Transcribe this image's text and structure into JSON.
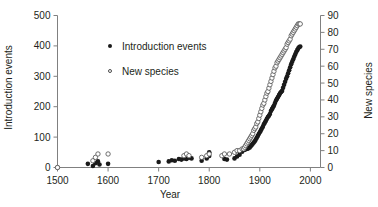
{
  "figure": {
    "xlabel": "Year",
    "ylabel_left": "Introduction events",
    "ylabel_right": "New species",
    "legend": [
      {
        "label": "Introduction events",
        "marker": "filled-circle-icon"
      },
      {
        "label": "New species",
        "marker": "open-circle-icon"
      }
    ]
  },
  "chart_data": {
    "type": "scatter",
    "title": "",
    "xlabel": "Year",
    "ylabel": "Introduction events",
    "y2label": "New species",
    "grid": false,
    "legend_position": "upper-left-inside",
    "xlim": [
      1500,
      2020
    ],
    "xticks": [
      1500,
      1600,
      1700,
      1800,
      1900,
      2000
    ],
    "ylim": [
      0,
      500
    ],
    "yticks": [
      0,
      100,
      200,
      300,
      400,
      500
    ],
    "y2lim": [
      0,
      90
    ],
    "y2ticks": [
      0,
      10,
      20,
      30,
      40,
      50,
      60,
      70,
      80,
      90
    ],
    "series": [
      {
        "name": "Introduction events",
        "marker": "filled-circle",
        "color": "#1a1a1a",
        "axis": "left",
        "points": [
          [
            1500,
            0
          ],
          [
            1560,
            12
          ],
          [
            1570,
            5
          ],
          [
            1575,
            14
          ],
          [
            1580,
            20
          ],
          [
            1583,
            10
          ],
          [
            1600,
            12
          ],
          [
            1700,
            18
          ],
          [
            1720,
            20
          ],
          [
            1726,
            24
          ],
          [
            1732,
            22
          ],
          [
            1740,
            28
          ],
          [
            1745,
            26
          ],
          [
            1750,
            30
          ],
          [
            1755,
            28
          ],
          [
            1760,
            32
          ],
          [
            1765,
            30
          ],
          [
            1785,
            22
          ],
          [
            1795,
            30
          ],
          [
            1800,
            38
          ],
          [
            1800,
            50
          ],
          [
            1830,
            28
          ],
          [
            1835,
            26
          ],
          [
            1850,
            30
          ],
          [
            1855,
            36
          ],
          [
            1860,
            42
          ],
          [
            1865,
            52
          ],
          [
            1870,
            58
          ],
          [
            1872,
            60
          ],
          [
            1874,
            62
          ],
          [
            1876,
            62
          ],
          [
            1878,
            64
          ],
          [
            1880,
            66
          ],
          [
            1882,
            70
          ],
          [
            1884,
            74
          ],
          [
            1886,
            78
          ],
          [
            1888,
            82
          ],
          [
            1890,
            86
          ],
          [
            1892,
            92
          ],
          [
            1894,
            98
          ],
          [
            1896,
            104
          ],
          [
            1898,
            110
          ],
          [
            1900,
            116
          ],
          [
            1902,
            122
          ],
          [
            1904,
            128
          ],
          [
            1906,
            134
          ],
          [
            1908,
            142
          ],
          [
            1910,
            148
          ],
          [
            1912,
            154
          ],
          [
            1914,
            160
          ],
          [
            1916,
            166
          ],
          [
            1918,
            170
          ],
          [
            1920,
            176
          ],
          [
            1922,
            186
          ],
          [
            1924,
            192
          ],
          [
            1926,
            198
          ],
          [
            1928,
            204
          ],
          [
            1930,
            212
          ],
          [
            1932,
            220
          ],
          [
            1934,
            226
          ],
          [
            1936,
            232
          ],
          [
            1938,
            238
          ],
          [
            1940,
            244
          ],
          [
            1942,
            248
          ],
          [
            1944,
            252
          ],
          [
            1946,
            262
          ],
          [
            1948,
            272
          ],
          [
            1950,
            282
          ],
          [
            1952,
            292
          ],
          [
            1954,
            300
          ],
          [
            1956,
            310
          ],
          [
            1958,
            320
          ],
          [
            1960,
            330
          ],
          [
            1962,
            340
          ],
          [
            1964,
            348
          ],
          [
            1966,
            356
          ],
          [
            1968,
            364
          ],
          [
            1970,
            372
          ],
          [
            1972,
            380
          ],
          [
            1974,
            386
          ],
          [
            1976,
            392
          ],
          [
            1978,
            396
          ],
          [
            1980,
            398
          ]
        ]
      },
      {
        "name": "New species",
        "marker": "open-circle",
        "color": "#4d4d4d",
        "axis": "right",
        "points": [
          [
            1500,
            0
          ],
          [
            1570,
            4
          ],
          [
            1575,
            6
          ],
          [
            1580,
            8
          ],
          [
            1600,
            8
          ],
          [
            1750,
            7
          ],
          [
            1755,
            8
          ],
          [
            1760,
            7
          ],
          [
            1785,
            6
          ],
          [
            1795,
            7
          ],
          [
            1800,
            8
          ],
          [
            1825,
            7
          ],
          [
            1830,
            8
          ],
          [
            1840,
            8
          ],
          [
            1850,
            9
          ],
          [
            1855,
            10
          ],
          [
            1860,
            10
          ],
          [
            1865,
            11
          ],
          [
            1868,
            11
          ],
          [
            1870,
            12
          ],
          [
            1872,
            13
          ],
          [
            1874,
            14
          ],
          [
            1876,
            15
          ],
          [
            1878,
            16
          ],
          [
            1880,
            17
          ],
          [
            1882,
            18
          ],
          [
            1884,
            19
          ],
          [
            1886,
            20
          ],
          [
            1888,
            22
          ],
          [
            1890,
            23
          ],
          [
            1892,
            24
          ],
          [
            1894,
            26
          ],
          [
            1896,
            27
          ],
          [
            1898,
            29
          ],
          [
            1900,
            31
          ],
          [
            1902,
            33
          ],
          [
            1904,
            35
          ],
          [
            1906,
            37
          ],
          [
            1908,
            38
          ],
          [
            1910,
            40
          ],
          [
            1912,
            42
          ],
          [
            1914,
            44
          ],
          [
            1916,
            45
          ],
          [
            1918,
            47
          ],
          [
            1920,
            49
          ],
          [
            1922,
            51
          ],
          [
            1924,
            53
          ],
          [
            1926,
            55
          ],
          [
            1928,
            57
          ],
          [
            1930,
            59
          ],
          [
            1932,
            60
          ],
          [
            1934,
            62
          ],
          [
            1936,
            63
          ],
          [
            1938,
            64
          ],
          [
            1940,
            65
          ],
          [
            1942,
            66
          ],
          [
            1944,
            67
          ],
          [
            1946,
            68
          ],
          [
            1948,
            69
          ],
          [
            1950,
            70
          ],
          [
            1952,
            71
          ],
          [
            1954,
            73
          ],
          [
            1956,
            74
          ],
          [
            1958,
            75
          ],
          [
            1960,
            76
          ],
          [
            1962,
            78
          ],
          [
            1964,
            79
          ],
          [
            1966,
            80
          ],
          [
            1968,
            81
          ],
          [
            1970,
            82
          ],
          [
            1972,
            83
          ],
          [
            1974,
            84
          ],
          [
            1976,
            85
          ],
          [
            1978,
            85
          ],
          [
            1980,
            85
          ]
        ]
      }
    ]
  }
}
